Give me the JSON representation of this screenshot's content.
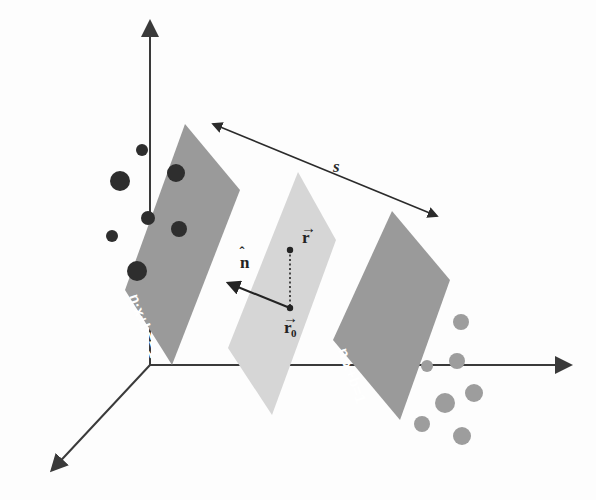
{
  "figure": {
    "background_color": "#fdfdfd",
    "width": 596,
    "height": 500
  },
  "colors": {
    "axis": "#3a3a3a",
    "plane_outer": "#9a9a9a",
    "plane_middle": "#d6d6d6",
    "dark_point": "#2e2e2e",
    "light_point": "#9d9d9d",
    "label_text": "#ffffff",
    "vector": "#232323"
  },
  "axes": {
    "origin": {
      "x": 150,
      "y": 365
    },
    "vertical": {
      "tip_x": 150,
      "tip_y": 22,
      "name": "vertical-axis"
    },
    "horizontal": {
      "tip_x": 570,
      "tip_y": 365,
      "name": "horizontal-axis"
    },
    "depth": {
      "tip_x": 52,
      "tip_y": 470,
      "name": "depth-axis"
    }
  },
  "planes": [
    {
      "id": "plane-negative",
      "label": "n·x+b=−1",
      "fill": "#9a9a9a",
      "points": "185,124 240,190 172,365 125,290",
      "label_x": 129,
      "label_y": 296,
      "label_rotation": 71
    },
    {
      "id": "plane-decision",
      "label": "",
      "fill": "#d6d6d6",
      "points": "298,172 336,240 272,415 228,348",
      "label_x": 0,
      "label_y": 0,
      "label_rotation": 0
    },
    {
      "id": "plane-positive",
      "label": "n·x+b=1",
      "fill": "#9a9a9a",
      "points": "392,211 450,280 400,420 333,340",
      "label_x": 338,
      "label_y": 350,
      "label_rotation": 71
    }
  ],
  "margin_arrow": {
    "label": "s",
    "label_x": 333,
    "label_y": 172,
    "start_x": 213,
    "start_y": 124,
    "end_x": 437,
    "end_y": 216,
    "name": "margin-distance-arrow"
  },
  "vectors": {
    "normal": {
      "label": "n",
      "hat": "ˆ",
      "label_x": 240,
      "label_y": 268,
      "start_x": 290,
      "start_y": 308,
      "end_x": 228,
      "end_y": 283
    },
    "r": {
      "label": "r",
      "arrow": "→",
      "label_x": 302,
      "label_y": 243,
      "point_x": 290,
      "point_y": 250
    },
    "r_zero": {
      "label": "r",
      "subscript": "0",
      "arrow": "→",
      "label_x": 284,
      "label_y": 333,
      "point_x": 290,
      "point_y": 308
    },
    "dotted_connector": {
      "start_x": 290,
      "start_y": 250,
      "end_x": 290,
      "end_y": 308
    }
  },
  "data_points": {
    "negative_class": [
      {
        "cx": 142,
        "cy": 150,
        "r": 6
      },
      {
        "cx": 120,
        "cy": 181,
        "r": 10
      },
      {
        "cx": 176,
        "cy": 173,
        "r": 9
      },
      {
        "cx": 148,
        "cy": 218,
        "r": 7
      },
      {
        "cx": 179,
        "cy": 229,
        "r": 8
      },
      {
        "cx": 112,
        "cy": 236,
        "r": 6
      },
      {
        "cx": 137,
        "cy": 271,
        "r": 10
      }
    ],
    "positive_class": [
      {
        "cx": 461,
        "cy": 322,
        "r": 8
      },
      {
        "cx": 427,
        "cy": 366,
        "r": 6
      },
      {
        "cx": 457,
        "cy": 361,
        "r": 8
      },
      {
        "cx": 474,
        "cy": 393,
        "r": 9
      },
      {
        "cx": 445,
        "cy": 403,
        "r": 10
      },
      {
        "cx": 422,
        "cy": 424,
        "r": 8
      },
      {
        "cx": 462,
        "cy": 436,
        "r": 9
      }
    ]
  }
}
